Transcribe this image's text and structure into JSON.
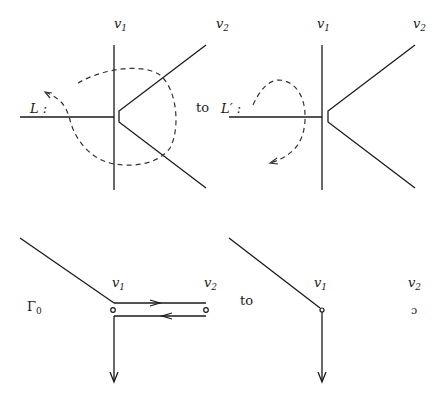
{
  "figure": {
    "colors": {
      "ink": "#1a1a1a",
      "background": "#ffffff"
    }
  },
  "panels": {
    "top_left": {
      "labels": {
        "v1": "v",
        "v1_sub": "1",
        "v2": "v",
        "v2_sub": "2",
        "loop": "L :",
        "connector": "to"
      }
    },
    "top_right": {
      "labels": {
        "v1": "v",
        "v1_sub": "1",
        "v2": "v",
        "v2_sub": "2",
        "loop": "L′ :"
      }
    },
    "bottom_left": {
      "labels": {
        "graph": "Γ",
        "graph_sub": "0",
        "v1": "v",
        "v1_sub": "1",
        "v2": "v",
        "v2_sub": "2"
      }
    },
    "bottom_right": {
      "labels": {
        "connector": "to",
        "v1": "v",
        "v1_sub": "1",
        "v2": "v",
        "v2_sub": "2",
        "v2_marker": "ɔ"
      }
    }
  }
}
